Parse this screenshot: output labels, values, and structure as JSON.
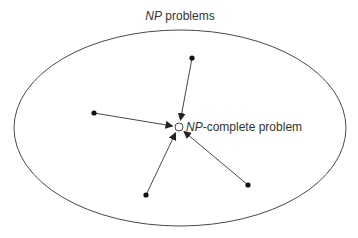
{
  "diagram": {
    "title_italic": "NP",
    "title_rest": " problems",
    "center_label_italic": "NP",
    "center_label_rest": "-complete problem",
    "colors": {
      "stroke": "#333333",
      "text": "#333333",
      "background": "#ffffff"
    },
    "ellipse": {
      "cx": 180,
      "cy": 128,
      "rx": 166,
      "ry": 98
    },
    "center_node": {
      "x": 179,
      "y": 127,
      "r": 4
    },
    "source_nodes": [
      {
        "name": "top",
        "x": 192,
        "y": 58
      },
      {
        "name": "left",
        "x": 94,
        "y": 113
      },
      {
        "name": "bottom-left",
        "x": 146,
        "y": 195
      },
      {
        "name": "bottom-right",
        "x": 248,
        "y": 185
      }
    ]
  }
}
